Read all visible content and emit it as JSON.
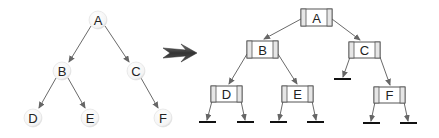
{
  "left_tree": {
    "title": "",
    "nodes": [
      {
        "id": "A",
        "label": "A",
        "x": 98,
        "y": 20
      },
      {
        "id": "B",
        "label": "B",
        "x": 62,
        "y": 71
      },
      {
        "id": "C",
        "label": "C",
        "x": 136,
        "y": 71
      },
      {
        "id": "D",
        "label": "D",
        "x": 33,
        "y": 118
      },
      {
        "id": "E",
        "label": "E",
        "x": 90,
        "y": 118
      },
      {
        "id": "F",
        "label": "F",
        "x": 163,
        "y": 118
      }
    ],
    "edges": [
      [
        "A",
        "B"
      ],
      [
        "A",
        "C"
      ],
      [
        "B",
        "D"
      ],
      [
        "B",
        "E"
      ],
      [
        "C",
        "F"
      ]
    ]
  },
  "transform_arrow": {
    "icon": "right-arrow-icon",
    "color": "#3a3a3a"
  },
  "right_tree": {
    "nodes": [
      {
        "id": "A",
        "label": "A",
        "x": 316,
        "y": 18
      },
      {
        "id": "B",
        "label": "B",
        "x": 262,
        "y": 50
      },
      {
        "id": "C",
        "label": "C",
        "x": 364,
        "y": 50
      },
      {
        "id": "D",
        "label": "D",
        "x": 226,
        "y": 94
      },
      {
        "id": "E",
        "label": "E",
        "x": 297,
        "y": 94
      },
      {
        "id": "F",
        "label": "F",
        "x": 389,
        "y": 95
      }
    ],
    "edges": [
      [
        "A",
        "B"
      ],
      [
        "A",
        "C"
      ],
      [
        "B",
        "D"
      ],
      [
        "B",
        "E"
      ],
      [
        "C",
        "F"
      ]
    ],
    "null_pointers": [
      "C.left",
      "D.left",
      "D.right",
      "E.left",
      "E.right",
      "F.left",
      "F.right"
    ]
  },
  "colors": {
    "edge": "#666666",
    "node_border": "#555555",
    "node_fill": "#ffffff",
    "null_bar": "#111111"
  }
}
